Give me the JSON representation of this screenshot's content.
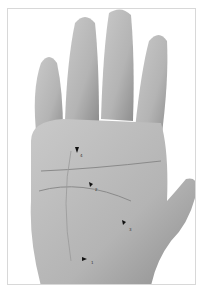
{
  "figure": {
    "arrows": [
      {
        "label": "4",
        "x": 76,
        "y": 150
      },
      {
        "label": "2",
        "x": 90,
        "y": 184
      },
      {
        "label": "3",
        "x": 123,
        "y": 222
      },
      {
        "label": "1",
        "x": 84,
        "y": 258
      }
    ],
    "colors": {
      "skin": "#bdbdbd",
      "shadow": "#8a8a8a",
      "background": "#ffffff",
      "arrow": "#111111"
    }
  }
}
